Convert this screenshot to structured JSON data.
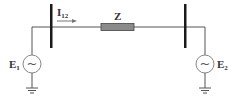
{
  "diagram": {
    "current_label": {
      "main": "I",
      "sub": "12"
    },
    "impedance_label": "Z",
    "source_left": {
      "main": "E",
      "sub": "1",
      "symbol": "~"
    },
    "source_right": {
      "main": "E",
      "sub": "2",
      "symbol": "~"
    },
    "colors": {
      "wire": "#555555",
      "bus": "#1a1a1a",
      "impedance_fill": "#8a8a8a",
      "impedance_stroke": "#444444",
      "source_stroke": "#888888",
      "text": "#333333"
    }
  }
}
